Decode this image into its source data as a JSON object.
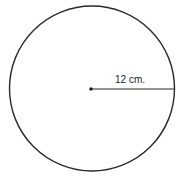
{
  "diagram": {
    "shape": "circle",
    "center": {
      "x": 91,
      "y": 89
    },
    "radius_px": 83,
    "stroke_color": "#2a2a2a",
    "radius_line": {
      "label": "12 cm.",
      "from": {
        "x": 91,
        "y": 89
      },
      "to": {
        "x": 174,
        "y": 89
      }
    }
  }
}
